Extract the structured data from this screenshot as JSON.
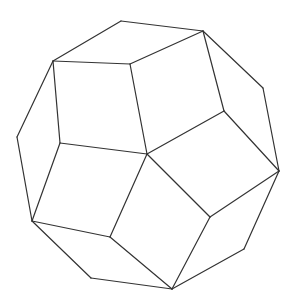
{
  "figure": {
    "type": "polyhedron-wireframe",
    "shape": "tetartoid-like polyhedron with pentagonal faces",
    "stroke_color": "#333333",
    "background": "#ffffff",
    "width": 296,
    "height": 305,
    "vertices": {
      "A": [
        121,
        21
      ],
      "B": [
        203,
        31
      ],
      "C": [
        263,
        88
      ],
      "D": [
        279,
        171
      ],
      "E": [
        244,
        249
      ],
      "F": [
        172,
        289
      ],
      "G": [
        91,
        278
      ],
      "H": [
        32,
        221
      ],
      "I": [
        17,
        137
      ],
      "J": [
        53,
        61
      ],
      "K": [
        130,
        64
      ],
      "L": [
        224,
        111
      ],
      "M": [
        147,
        154
      ],
      "N": [
        60,
        143
      ],
      "O": [
        110,
        237
      ],
      "P": [
        210,
        217
      ]
    },
    "edges": [
      [
        "A",
        "B"
      ],
      [
        "B",
        "C"
      ],
      [
        "C",
        "D"
      ],
      [
        "D",
        "E"
      ],
      [
        "E",
        "F"
      ],
      [
        "F",
        "G"
      ],
      [
        "G",
        "H"
      ],
      [
        "H",
        "I"
      ],
      [
        "I",
        "J"
      ],
      [
        "J",
        "A"
      ],
      [
        "J",
        "K"
      ],
      [
        "K",
        "B"
      ],
      [
        "B",
        "L"
      ],
      [
        "L",
        "D"
      ],
      [
        "L",
        "M"
      ],
      [
        "K",
        "M"
      ],
      [
        "J",
        "N"
      ],
      [
        "N",
        "M"
      ],
      [
        "N",
        "H"
      ],
      [
        "H",
        "O"
      ],
      [
        "O",
        "M"
      ],
      [
        "O",
        "F"
      ],
      [
        "M",
        "P"
      ],
      [
        "P",
        "D"
      ],
      [
        "P",
        "F"
      ]
    ]
  }
}
